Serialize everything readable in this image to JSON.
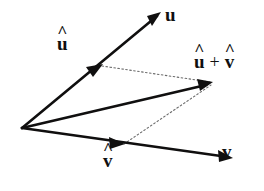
{
  "figure": {
    "background_color": "#ffffff",
    "stroke_color": "#100f0f",
    "dotted_color": "#6b6b6b",
    "width": 264,
    "height": 191
  },
  "labels": {
    "u_hat": {
      "base": "u",
      "accent": "^",
      "text": "û"
    },
    "u": {
      "base": "u",
      "accent": "",
      "text": "u"
    },
    "sum": {
      "left_base": "u",
      "left_accent": "^",
      "operator": "+",
      "right_base": "v",
      "right_accent": "^",
      "text": "û + v̂"
    },
    "v_hat": {
      "base": "v",
      "accent": "^",
      "text": "v̂"
    },
    "v": {
      "base": "v",
      "accent": "",
      "text": "v"
    }
  },
  "geometry": {
    "origin": {
      "x": 22,
      "y": 128
    },
    "vectors": [
      {
        "name": "u",
        "label": "u",
        "from": {
          "x": 22,
          "y": 128
        },
        "to": {
          "x": 160,
          "y": 13
        },
        "style": "solid",
        "intermediate_arrow": {
          "x": 100,
          "y": 65,
          "label": "u-hat"
        }
      },
      {
        "name": "v",
        "label": "v",
        "from": {
          "x": 22,
          "y": 128
        },
        "to": {
          "x": 231,
          "y": 158
        },
        "style": "solid",
        "intermediate_arrow": {
          "x": 122,
          "y": 143,
          "label": "v-hat"
        }
      },
      {
        "name": "resultant",
        "label": "u-hat + v-hat",
        "from": {
          "x": 22,
          "y": 128
        },
        "to": {
          "x": 212,
          "y": 83
        },
        "style": "solid",
        "intermediate_arrow": null
      }
    ],
    "construction_lines": [
      {
        "name": "u-hat-to-resultant",
        "from": {
          "x": 102,
          "y": 66
        },
        "to": {
          "x": 210,
          "y": 82
        },
        "style": "dotted"
      },
      {
        "name": "v-hat-to-resultant",
        "from": {
          "x": 124,
          "y": 144
        },
        "to": {
          "x": 211,
          "y": 85
        },
        "style": "dotted"
      }
    ]
  }
}
